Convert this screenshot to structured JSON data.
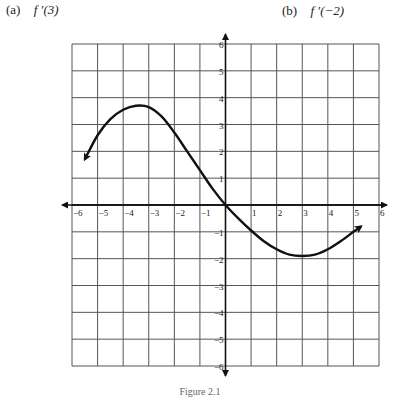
{
  "questions": [
    {
      "tag": "(a)",
      "expr": "f ′(3)"
    },
    {
      "tag": "(b)",
      "expr": "f ′(−2)"
    }
  ],
  "caption": "Figure 2.1",
  "chart_data": {
    "type": "line",
    "title": "",
    "xlabel": "",
    "ylabel": "",
    "xlim": [
      -6,
      6
    ],
    "ylim": [
      -6,
      6
    ],
    "grid": true,
    "x_ticks": [
      "−6",
      "−5",
      "−4",
      "−3",
      "−2",
      "−1",
      "1",
      "2",
      "3",
      "4",
      "5",
      "6"
    ],
    "y_ticks": [
      "6",
      "5",
      "4",
      "3",
      "2",
      "1",
      "−1",
      "−2",
      "−3",
      "−4",
      "−5",
      "−6"
    ],
    "series": [
      {
        "name": "f",
        "arrows_both_ends": true,
        "x": [
          -5.5,
          -5,
          -4.5,
          -4,
          -3.5,
          -3,
          -2.5,
          -2,
          -1.5,
          -1,
          -0.5,
          0,
          0.5,
          1,
          1.5,
          2,
          2.5,
          3,
          3.5,
          4,
          4.5,
          5,
          5.3
        ],
        "y": [
          1.7,
          2.6,
          3.2,
          3.55,
          3.7,
          3.65,
          3.3,
          2.7,
          2.0,
          1.3,
          0.6,
          0,
          -0.5,
          -0.95,
          -1.35,
          -1.65,
          -1.85,
          -1.9,
          -1.85,
          -1.65,
          -1.35,
          -1.0,
          -0.8
        ]
      }
    ]
  }
}
